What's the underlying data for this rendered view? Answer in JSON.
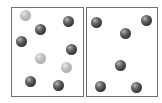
{
  "diagram": {
    "panels": [
      {
        "name": "left-container",
        "box": {
          "x": 11,
          "y": 7,
          "w": 73,
          "h": 90
        },
        "particles": [
          {
            "type": "light",
            "x": 25,
            "y": 15
          },
          {
            "type": "dark",
            "x": 40,
            "y": 29
          },
          {
            "type": "dark",
            "x": 68,
            "y": 21
          },
          {
            "type": "dark",
            "x": 21,
            "y": 41
          },
          {
            "type": "dark",
            "x": 71,
            "y": 49
          },
          {
            "type": "light",
            "x": 40,
            "y": 58
          },
          {
            "type": "light",
            "x": 66,
            "y": 67
          },
          {
            "type": "dark",
            "x": 30,
            "y": 81
          },
          {
            "type": "dark",
            "x": 58,
            "y": 85
          }
        ]
      },
      {
        "name": "right-container",
        "box": {
          "x": 86,
          "y": 7,
          "w": 72,
          "h": 90
        },
        "particles": [
          {
            "type": "dark",
            "x": 96,
            "y": 22
          },
          {
            "type": "dark",
            "x": 125,
            "y": 33
          },
          {
            "type": "dark",
            "x": 146,
            "y": 20
          },
          {
            "type": "dark",
            "x": 120,
            "y": 65
          },
          {
            "type": "dark",
            "x": 100,
            "y": 86
          },
          {
            "type": "dark",
            "x": 136,
            "y": 87
          }
        ]
      }
    ],
    "colors": {
      "dark": "#3a3a3a",
      "light": "#b0b0b0",
      "border": "#707070"
    },
    "sphere_diameter": 11
  }
}
